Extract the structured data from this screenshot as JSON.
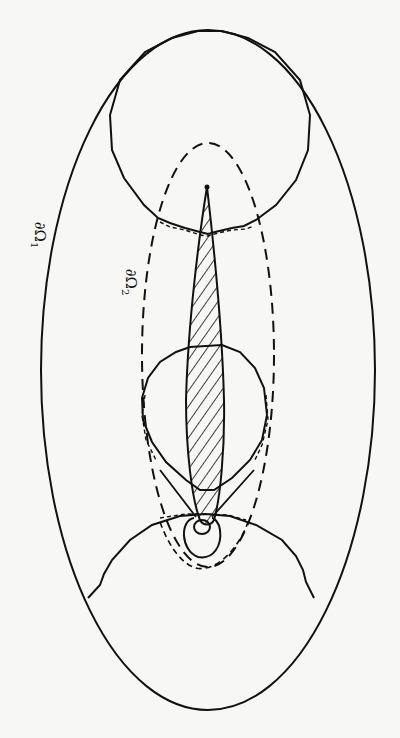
{
  "figure": {
    "labels": {
      "outer_boundary": "∂Ω",
      "outer_boundary_sub": "1",
      "inner_boundary": "∂Ω",
      "inner_boundary_sub": "2"
    },
    "colors": {
      "background": "#f7f7f5",
      "ink": "#111111"
    },
    "elements": [
      "outer ellipse boundary ∂Ω1 (solid)",
      "inner dashed ellipse boundary ∂Ω2",
      "hatched slender airfoil-like body along vertical axis",
      "upper large circle (solid) intersecting outer ellipse",
      "middle circle around body (solid)",
      "lower large circular arc (solid) near bottom",
      "small circles around body tip at bottom"
    ]
  }
}
